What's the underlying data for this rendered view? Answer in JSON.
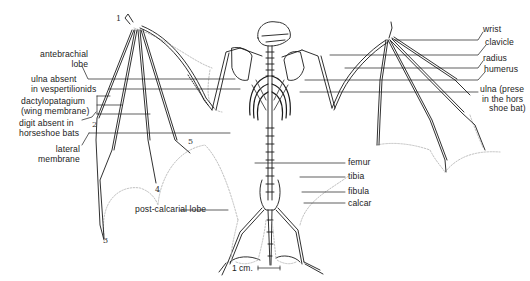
{
  "diagram": {
    "left_labels": [
      {
        "id": "antebrachial-lobe",
        "line1": "antebrachial",
        "line2": "lobe"
      },
      {
        "id": "ulna-absent",
        "line1": "ulna absent",
        "line2": "in vespertilionids"
      },
      {
        "id": "dactylopatagium",
        "line1": "dactylopatagium",
        "line2": "(wing membrane)"
      },
      {
        "id": "digit-absent",
        "line1": "digit absent in",
        "line2": "horseshoe bats"
      },
      {
        "id": "lateral-membrane",
        "line1": "lateral",
        "line2": "membrane"
      }
    ],
    "right_labels": [
      {
        "id": "wrist",
        "text": "wrist"
      },
      {
        "id": "clavicle",
        "text": "clavicle"
      },
      {
        "id": "radius",
        "text": "radius"
      },
      {
        "id": "humerus",
        "text": "humerus"
      },
      {
        "id": "ulna-present",
        "line1": "ulna (prese",
        "line2": "in the hors",
        "line3": "shoe bat)"
      }
    ],
    "leg_labels": [
      {
        "id": "femur",
        "text": "femur"
      },
      {
        "id": "tibia",
        "text": "tibia"
      },
      {
        "id": "fibula",
        "text": "fibula"
      },
      {
        "id": "calcar",
        "text": "calcar"
      }
    ],
    "bottom_labels": {
      "post_calcarial_lobe": "post-calcarial lobe"
    },
    "digit_numbers": {
      "d1": "1",
      "d2": "2",
      "d3": "3",
      "d4": "4",
      "d5": "5"
    },
    "scale_bar": {
      "text": "1 cm."
    },
    "colors": {
      "ink": "#1a1a1a",
      "membrane": "#b8b8b8",
      "background": "#ffffff"
    }
  }
}
